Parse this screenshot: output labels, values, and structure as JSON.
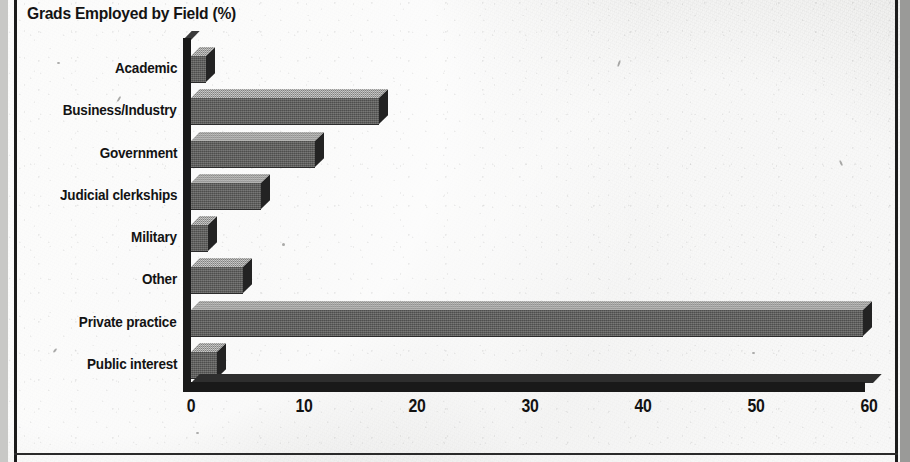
{
  "chart_data": {
    "type": "bar",
    "orientation": "horizontal",
    "title": "Grads Employed by Field (%)",
    "xlabel": "",
    "ylabel": "",
    "categories": [
      "Academic",
      "Business/Industry",
      "Government",
      "Judicial clerkships",
      "Military",
      "Other",
      "Private practice",
      "Public interest"
    ],
    "values": [
      1.3,
      16.6,
      11.0,
      6.2,
      1.5,
      4.6,
      59.5,
      2.3
    ],
    "xlim": [
      0,
      60
    ],
    "xticks": [
      0,
      10,
      20,
      30,
      40,
      50,
      60
    ],
    "xtick_labels": [
      "0",
      "10",
      "20",
      "30",
      "40",
      "50",
      "60"
    ],
    "grid": false,
    "legend": false,
    "style": "3d-scanned-print",
    "colors": {
      "bar_front": "#5e5e5c",
      "bar_top": "#9d9d9b",
      "bar_side": "#232323",
      "axis": "#191919",
      "text": "#131313",
      "background": "#e9e9e7",
      "frame": "#1b1b1b"
    }
  },
  "frame": {
    "left_rule": "vertical-black-rule",
    "right_rule": "vertical-black-rule",
    "bottom_rule": "horizontal-black-rule"
  }
}
